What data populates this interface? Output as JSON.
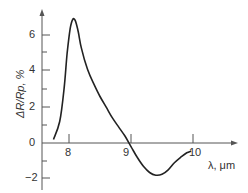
{
  "chart_data": {
    "type": "line",
    "title": "",
    "xlabel": "λ, μm",
    "ylabel": "ΔR/Rp, %",
    "xlim": [
      7.6,
      10.8
    ],
    "ylim": [
      -2.5,
      8
    ],
    "x_ticks": [
      "8",
      "9",
      "10"
    ],
    "y_ticks": [
      "6",
      "4",
      "2",
      "0",
      "-2"
    ],
    "grid": false,
    "legend": null,
    "series": [
      {
        "name": "ΔR/Rp",
        "x": [
          7.75,
          7.85,
          7.92,
          7.97,
          8.02,
          8.06,
          8.1,
          8.15,
          8.2,
          8.3,
          8.4,
          8.5,
          8.6,
          8.7,
          8.8,
          8.9,
          9.0,
          9.1,
          9.2,
          9.3,
          9.4,
          9.5,
          9.6,
          9.7,
          9.8,
          9.9,
          9.97
        ],
        "values": [
          0.2,
          1.2,
          3.0,
          5.0,
          6.4,
          6.9,
          6.85,
          6.2,
          5.3,
          4.1,
          3.3,
          2.6,
          2.0,
          1.4,
          0.9,
          0.4,
          -0.2,
          -0.8,
          -1.3,
          -1.65,
          -1.8,
          -1.75,
          -1.5,
          -1.1,
          -0.8,
          -0.55,
          -0.45
        ]
      }
    ]
  },
  "labels": {
    "xlabel": "λ, μm",
    "ylabel": "ΔR/Rp, %",
    "x8": "8",
    "x9": "9",
    "x10": "10",
    "y6": "6",
    "y4": "4",
    "y2": "2",
    "y0": "0",
    "ym2": "−2"
  }
}
